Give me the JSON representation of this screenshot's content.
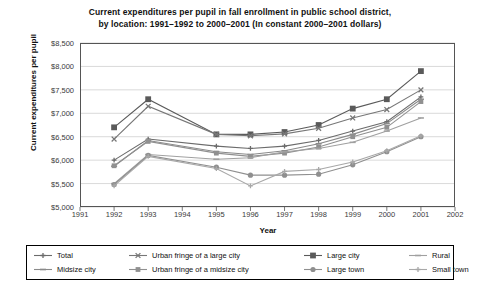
{
  "chart_data": {
    "type": "line",
    "title": "Current expenditures per pupil in fall enrollment in public school district, by location: 1991–1992 to 2000–2001 (In constant 2000–2001 dollars)",
    "title_line1": "Current expenditures per pupil in fall enrollment in public school district,",
    "title_line2": "by location: 1991–1992 to 2000–2001 (In constant 2000–2001 dollars)",
    "xlabel": "Year",
    "ylabel": "Current expenditures per pupil",
    "grid": true,
    "legend_position": "bottom",
    "xlim": [
      1991,
      2002
    ],
    "ylim": [
      5000,
      8500
    ],
    "ytick_step": 500,
    "xticks": [
      1991,
      1992,
      1993,
      1994,
      1995,
      1996,
      1997,
      1998,
      1999,
      2000,
      2001,
      2002
    ],
    "ytick_labels": [
      "$5,000",
      "$5,500",
      "$6,000",
      "$6,500",
      "$7,000",
      "$7,500",
      "$8,000",
      "$8,500"
    ],
    "ytick_values": [
      5000,
      5500,
      6000,
      6500,
      7000,
      7500,
      8000,
      8500
    ],
    "x": [
      1992,
      1993,
      1995,
      1996,
      1997,
      1998,
      1999,
      2000,
      2001
    ],
    "series": [
      {
        "name": "Large city",
        "marker": "square",
        "color": "#5a5a5a",
        "values": [
          6700,
          7300,
          6550,
          6550,
          6600,
          6750,
          7100,
          7300,
          7900
        ]
      },
      {
        "name": "Urban fringe of a large city",
        "marker": "x",
        "color": "#777777",
        "values": [
          6450,
          7150,
          6550,
          6520,
          6560,
          6680,
          6900,
          7080,
          7500
        ]
      },
      {
        "name": "Total",
        "marker": "plus",
        "color": "#6b6b6b",
        "values": [
          6000,
          6450,
          6300,
          6250,
          6300,
          6420,
          6620,
          6820,
          7350
        ]
      },
      {
        "name": "Midsize city",
        "marker": "dash",
        "color": "#8a8a8a",
        "values": [
          5870,
          6420,
          6180,
          6120,
          6200,
          6350,
          6550,
          6780,
          7300
        ]
      },
      {
        "name": "Urban fringe of a midsize city",
        "marker": "square-small",
        "color": "#909090",
        "values": [
          5880,
          6400,
          6150,
          6080,
          6150,
          6280,
          6500,
          6700,
          7250
        ]
      },
      {
        "name": "Rural",
        "marker": "dash2",
        "color": "#a0a0a0",
        "values": [
          5500,
          6120,
          6020,
          6050,
          6180,
          6250,
          6380,
          6620,
          6900
        ]
      },
      {
        "name": "Large town",
        "marker": "circle",
        "color": "#8f8f8f",
        "values": [
          5480,
          6100,
          5850,
          5680,
          5680,
          5700,
          5900,
          6180,
          6500
        ]
      },
      {
        "name": "Small town",
        "marker": "plus2",
        "color": "#a8a8a8",
        "values": [
          5450,
          6080,
          5820,
          5450,
          5760,
          5800,
          5960,
          6200,
          6520
        ]
      }
    ],
    "legend_order": [
      "Total",
      "Urban fringe of a large city",
      "Large city",
      "Rural",
      "Midsize city",
      "Urban fringe of a midsize city",
      "Large town",
      "Small town"
    ]
  },
  "style": {
    "grid_color": "#c9c9c9",
    "axis_color": "#555555",
    "text_color": "#1a1a1a",
    "background": "#ffffff"
  }
}
